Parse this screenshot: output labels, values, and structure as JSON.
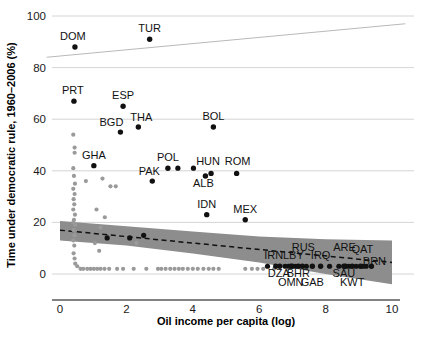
{
  "chart_data": {
    "type": "scatter",
    "title": "",
    "xlabel": "Oil income per capita (log)",
    "ylabel": "Time under democratic rule, 1960–2006 (%)",
    "xlim": [
      -0.4,
      10.4
    ],
    "ylim": [
      -4,
      103
    ],
    "xticks": [
      0,
      2,
      4,
      6,
      8,
      10
    ],
    "xtick_labels": [
      "0",
      "2",
      "4",
      "6",
      "8",
      "10"
    ],
    "yticks": [
      0,
      20,
      40,
      60,
      80,
      100
    ],
    "ytick_labels": [
      "0",
      "20",
      "40",
      "60",
      "80",
      "100"
    ],
    "grid": "horizontal",
    "legend": "none",
    "labeled_points": [
      {
        "label": "DOM",
        "x": 0.45,
        "y": 88,
        "label_dx": -2,
        "label_dy": -7
      },
      {
        "label": "TUR",
        "x": 2.7,
        "y": 91,
        "label_dx": 0,
        "label_dy": -7
      },
      {
        "label": "PRT",
        "x": 0.42,
        "y": 67,
        "label_dx": -1,
        "label_dy": -7
      },
      {
        "label": "ESP",
        "x": 1.9,
        "y": 65,
        "label_dx": 0,
        "label_dy": -7
      },
      {
        "label": "BGD",
        "x": 1.82,
        "y": 55,
        "label_dx": -9,
        "label_dy": -6
      },
      {
        "label": "THA",
        "x": 2.36,
        "y": 57,
        "label_dx": 3,
        "label_dy": -6
      },
      {
        "label": "BOL",
        "x": 4.62,
        "y": 57,
        "label_dx": 0,
        "label_dy": -7
      },
      {
        "label": "GHA",
        "x": 1.02,
        "y": 42,
        "label_dx": 0,
        "label_dy": -7
      },
      {
        "label": "POL",
        "x": 3.25,
        "y": 41,
        "label_dx": 0,
        "label_dy": -7
      },
      {
        "label": "PAK",
        "x": 2.78,
        "y": 36,
        "label_dx": -3,
        "label_dy": -6
      },
      {
        "label": "HUN",
        "x": 4.55,
        "y": 39,
        "label_dx": -3,
        "label_dy": -8
      },
      {
        "label": "ROM",
        "x": 5.32,
        "y": 39,
        "label_dx": 1,
        "label_dy": -8
      },
      {
        "label": "ALB",
        "x": 4.38,
        "y": 38,
        "label_dx": -2,
        "label_dy": 11
      },
      {
        "label": "IDN",
        "x": 4.42,
        "y": 23,
        "label_dx": 0,
        "label_dy": -7
      },
      {
        "label": "MEX",
        "x": 5.58,
        "y": 21,
        "label_dx": 0,
        "label_dy": -7
      },
      {
        "label": "IRN",
        "x": 6.5,
        "y": 3,
        "label_dx": -2,
        "label_dy": -7
      },
      {
        "label": "LBY",
        "x": 7.0,
        "y": 3,
        "label_dx": 1,
        "label_dy": -7
      },
      {
        "label": "RUS",
        "x": 7.3,
        "y": 3,
        "label_dx": 1,
        "label_dy": -15
      },
      {
        "label": "IRQ",
        "x": 7.85,
        "y": 3,
        "label_dx": 0,
        "label_dy": -7
      },
      {
        "label": "ARE",
        "x": 8.6,
        "y": 3,
        "label_dx": -1,
        "label_dy": -15
      },
      {
        "label": "QAT",
        "x": 9.05,
        "y": 3,
        "label_dx": 2,
        "label_dy": -13
      },
      {
        "label": "BRN",
        "x": 9.38,
        "y": 3,
        "label_dx": 3,
        "label_dy": -1
      },
      {
        "label": "DZA",
        "x": 6.62,
        "y": 3,
        "label_dx": -1,
        "label_dy": 11
      },
      {
        "label": "BHR",
        "x": 7.18,
        "y": 3,
        "label_dx": 0,
        "label_dy": 11
      },
      {
        "label": "SAU",
        "x": 8.55,
        "y": 3,
        "label_dx": 0,
        "label_dy": 11
      },
      {
        "label": "OMN",
        "x": 6.95,
        "y": 3,
        "label_dx": 0,
        "label_dy": 20
      },
      {
        "label": "GAB",
        "x": 7.6,
        "y": 3,
        "label_dx": 0,
        "label_dy": 20
      },
      {
        "label": "KWT",
        "x": 8.8,
        "y": 3,
        "label_dx": 0,
        "label_dy": 20
      }
    ],
    "unlabeled_dark_points": [
      {
        "x": 3.55,
        "y": 41
      },
      {
        "x": 4.02,
        "y": 41
      },
      {
        "x": 1.42,
        "y": 14
      },
      {
        "x": 2.52,
        "y": 15
      },
      {
        "x": 2.1,
        "y": 14
      },
      {
        "x": 6.25,
        "y": 3
      },
      {
        "x": 6.78,
        "y": 3
      },
      {
        "x": 6.88,
        "y": 3
      },
      {
        "x": 7.1,
        "y": 3
      },
      {
        "x": 7.42,
        "y": 3
      },
      {
        "x": 8.12,
        "y": 3
      },
      {
        "x": 8.4,
        "y": 3
      },
      {
        "x": 8.7,
        "y": 3
      },
      {
        "x": 8.92,
        "y": 3
      },
      {
        "x": 9.12,
        "y": 3
      },
      {
        "x": 9.22,
        "y": 3
      }
    ],
    "grey_cloud_points": [
      {
        "x": 0.4,
        "y": 54
      },
      {
        "x": 0.44,
        "y": 49
      },
      {
        "x": 0.44,
        "y": 47
      },
      {
        "x": 0.4,
        "y": 41
      },
      {
        "x": 0.42,
        "y": 38
      },
      {
        "x": 0.45,
        "y": 35
      },
      {
        "x": 0.4,
        "y": 33
      },
      {
        "x": 0.44,
        "y": 31
      },
      {
        "x": 0.41,
        "y": 29
      },
      {
        "x": 0.43,
        "y": 27
      },
      {
        "x": 0.4,
        "y": 25
      },
      {
        "x": 0.45,
        "y": 23
      },
      {
        "x": 0.42,
        "y": 21
      },
      {
        "x": 0.4,
        "y": 20
      },
      {
        "x": 0.46,
        "y": 19
      },
      {
        "x": 0.41,
        "y": 17
      },
      {
        "x": 0.44,
        "y": 15
      },
      {
        "x": 0.4,
        "y": 13
      },
      {
        "x": 0.43,
        "y": 11
      },
      {
        "x": 0.41,
        "y": 8
      },
      {
        "x": 0.44,
        "y": 6
      },
      {
        "x": 0.46,
        "y": 4
      },
      {
        "x": 0.52,
        "y": 3
      },
      {
        "x": 0.78,
        "y": 36
      },
      {
        "x": 1.28,
        "y": 37
      },
      {
        "x": 1.1,
        "y": 25
      },
      {
        "x": 1.35,
        "y": 22
      },
      {
        "x": 1.22,
        "y": 18
      },
      {
        "x": 1.05,
        "y": 12
      },
      {
        "x": 1.18,
        "y": 9
      },
      {
        "x": 1.52,
        "y": 34
      },
      {
        "x": 1.68,
        "y": 34
      },
      {
        "x": 2.3,
        "y": 12
      },
      {
        "x": 0.62,
        "y": 2
      },
      {
        "x": 0.7,
        "y": 2
      },
      {
        "x": 0.82,
        "y": 2
      },
      {
        "x": 0.92,
        "y": 2
      },
      {
        "x": 1.02,
        "y": 2
      },
      {
        "x": 1.12,
        "y": 2
      },
      {
        "x": 1.22,
        "y": 2
      },
      {
        "x": 1.34,
        "y": 2
      },
      {
        "x": 1.48,
        "y": 2
      },
      {
        "x": 1.72,
        "y": 2
      },
      {
        "x": 1.9,
        "y": 2
      },
      {
        "x": 2.22,
        "y": 2
      },
      {
        "x": 2.6,
        "y": 2
      },
      {
        "x": 2.95,
        "y": 2
      },
      {
        "x": 3.05,
        "y": 2
      },
      {
        "x": 3.18,
        "y": 2
      },
      {
        "x": 3.32,
        "y": 2
      },
      {
        "x": 3.45,
        "y": 2
      },
      {
        "x": 3.58,
        "y": 2
      },
      {
        "x": 3.7,
        "y": 2
      },
      {
        "x": 3.85,
        "y": 2
      },
      {
        "x": 4.0,
        "y": 2
      },
      {
        "x": 4.15,
        "y": 2
      },
      {
        "x": 4.32,
        "y": 2
      },
      {
        "x": 4.48,
        "y": 2
      },
      {
        "x": 4.62,
        "y": 2
      },
      {
        "x": 4.78,
        "y": 2
      },
      {
        "x": 5.58,
        "y": 2
      },
      {
        "x": 5.78,
        "y": 2
      },
      {
        "x": 5.95,
        "y": 2
      },
      {
        "x": 6.12,
        "y": 2
      },
      {
        "x": 6.45,
        "y": 2
      }
    ],
    "fit_line": {
      "x0": 0.0,
      "y0": 17.0,
      "x1": 10.0,
      "y1": 4.5,
      "style": "dashed"
    },
    "confidence_band": {
      "upper": [
        [
          0.0,
          20.5
        ],
        [
          2.0,
          18.5
        ],
        [
          4.0,
          16.5
        ],
        [
          6.0,
          14.5
        ],
        [
          8.0,
          13.5
        ],
        [
          10.0,
          13.0
        ]
      ],
      "lower": [
        [
          0.0,
          13.0
        ],
        [
          2.0,
          11.0
        ],
        [
          4.0,
          8.0
        ],
        [
          6.0,
          4.5
        ],
        [
          8.0,
          0.0
        ],
        [
          10.0,
          -4.0
        ]
      ],
      "color": "#8d8d8d"
    },
    "upper_trend_line": {
      "x0": -0.4,
      "y0": 84.0,
      "x1": 10.4,
      "y1": 97.0,
      "color": "#b9b9b9"
    }
  }
}
